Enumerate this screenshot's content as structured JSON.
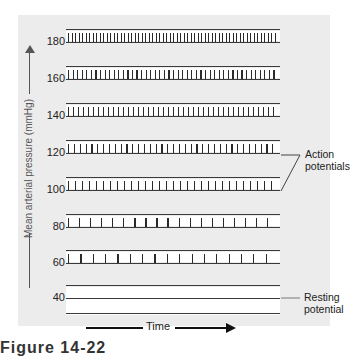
{
  "chart_data": {
    "type": "diagram",
    "title": "",
    "xlabel": "Time",
    "ylabel": "Mean arterial pressure (mmHg)",
    "rows": [
      {
        "pressure": 180,
        "label": "180",
        "tick_count": 60
      },
      {
        "pressure": 160,
        "label": "160",
        "tick_count": 46
      },
      {
        "pressure": 140,
        "label": "140",
        "tick_count": 42
      },
      {
        "pressure": 120,
        "label": "120",
        "tick_count": 36
      },
      {
        "pressure": 100,
        "label": "100",
        "tick_count": 30
      },
      {
        "pressure": 80,
        "label": "80",
        "tick_count": 19
      },
      {
        "pressure": 60,
        "label": "60",
        "tick_count": 17
      },
      {
        "pressure": 40,
        "label": "40",
        "tick_count": 0
      }
    ],
    "annotations": [
      {
        "text": "Action potentials",
        "points_to": [
          120,
          100
        ]
      },
      {
        "text": "Resting potential",
        "points_to": [
          40
        ]
      }
    ]
  },
  "axis": {
    "ylabel": "Mean arterial pressure (mmHg)",
    "xlabel": "Time"
  },
  "annotations": {
    "action_line1": "Action",
    "action_line2": "potentials",
    "resting_line1": "Resting",
    "resting_line2": "potential"
  },
  "caption": "Figure 14-22"
}
